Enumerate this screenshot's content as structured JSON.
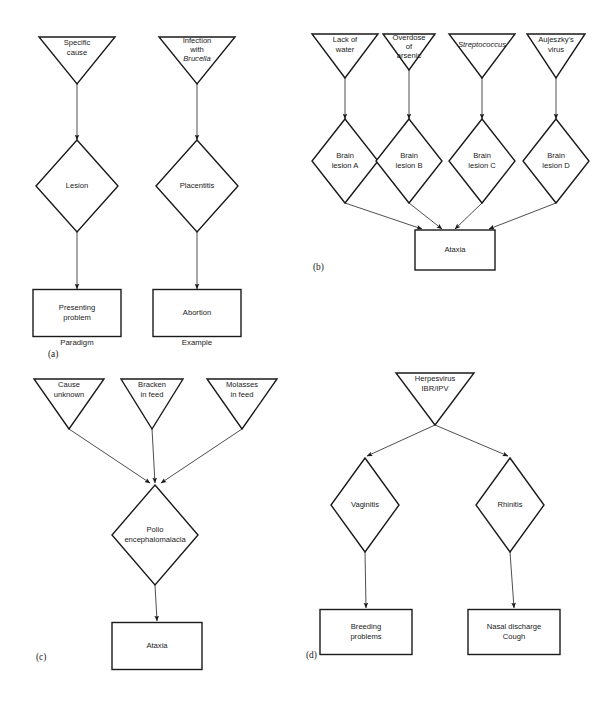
{
  "figure": {
    "background_color": "#ffffff",
    "line_color": "#1a1a1a",
    "connector_color": "#3a3a3a"
  },
  "panels": [
    {
      "id": "a",
      "label": "(a)",
      "label_x": 48,
      "label_y": 357,
      "columns": [
        {
          "caption": "Paradigm",
          "caption_x": 77,
          "caption_y": 345,
          "nodes": [
            {
              "shape": "triangle",
              "lines": [
                "Specific",
                "cause"
              ],
              "cx": 77,
              "cy": 37,
              "w": 76,
              "h": 47
            },
            {
              "shape": "diamond",
              "lines": [
                "Lesion"
              ],
              "cx": 77,
              "cy": 186,
              "w": 82,
              "h": 92
            },
            {
              "shape": "rect",
              "lines": [
                "Presenting",
                "problem"
              ],
              "cx": 77,
              "cy": 313,
              "w": 88,
              "h": 47
            }
          ],
          "arrows": [
            {
              "x1": 77,
              "y1": 84,
              "x2": 77,
              "y2": 140
            },
            {
              "x1": 77,
              "y1": 232,
              "x2": 77,
              "y2": 289
            }
          ]
        },
        {
          "caption": "Example",
          "caption_x": 197,
          "caption_y": 345,
          "nodes": [
            {
              "shape": "triangle",
              "lines": [
                "Infection",
                "with",
                "Brucella"
              ],
              "italic_lines": [
                2
              ],
              "cx": 197,
              "cy": 37,
              "w": 76,
              "h": 47
            },
            {
              "shape": "diamond",
              "lines": [
                "Placentitis"
              ],
              "cx": 197,
              "cy": 186,
              "w": 82,
              "h": 92
            },
            {
              "shape": "rect",
              "lines": [
                "Abortion"
              ],
              "cx": 197,
              "cy": 313,
              "w": 88,
              "h": 47
            }
          ],
          "arrows": [
            {
              "x1": 197,
              "y1": 84,
              "x2": 197,
              "y2": 140
            },
            {
              "x1": 197,
              "y1": 232,
              "x2": 197,
              "y2": 289
            }
          ]
        }
      ]
    },
    {
      "id": "b",
      "label": "(b)",
      "label_x": 313,
      "label_y": 270,
      "causes": [
        {
          "shape": "triangle",
          "lines": [
            "Lack of",
            "water"
          ],
          "cx": 345,
          "cy": 34,
          "w": 66,
          "h": 44
        },
        {
          "shape": "triangle",
          "lines": [
            "Overdose",
            "of",
            "arsenic"
          ],
          "cx": 409,
          "cy": 34,
          "w": 52,
          "h": 36
        },
        {
          "shape": "triangle",
          "lines": [
            "Streptococcus"
          ],
          "italic_lines": [
            0
          ],
          "cx": 482,
          "cy": 34,
          "w": 66,
          "h": 44
        },
        {
          "shape": "triangle",
          "lines": [
            "Aujeszky's",
            "virus"
          ],
          "cx": 556,
          "cy": 34,
          "w": 58,
          "h": 44
        }
      ],
      "lesions": [
        {
          "shape": "diamond",
          "lines": [
            "Brain",
            "lesion A"
          ],
          "cx": 345,
          "cy": 161,
          "w": 66,
          "h": 84
        },
        {
          "shape": "diamond",
          "lines": [
            "Brain",
            "lesion B"
          ],
          "cx": 409,
          "cy": 161,
          "w": 66,
          "h": 84
        },
        {
          "shape": "diamond",
          "lines": [
            "Brain",
            "lesion C"
          ],
          "cx": 482,
          "cy": 161,
          "w": 66,
          "h": 84
        },
        {
          "shape": "diamond",
          "lines": [
            "Brain",
            "lesion D"
          ],
          "cx": 556,
          "cy": 161,
          "w": 66,
          "h": 84
        }
      ],
      "outcome": {
        "shape": "rect",
        "lines": [
          "Ataxia"
        ],
        "cx": 455,
        "cy": 250,
        "w": 80,
        "h": 40
      },
      "arrows_down": [
        {
          "x1": 345,
          "y1": 78,
          "x2": 345,
          "y2": 119
        },
        {
          "x1": 409,
          "y1": 70,
          "x2": 409,
          "y2": 119
        },
        {
          "x1": 482,
          "y1": 78,
          "x2": 482,
          "y2": 119
        },
        {
          "x1": 556,
          "y1": 78,
          "x2": 556,
          "y2": 119
        }
      ],
      "arrows_converge": [
        {
          "x1": 345,
          "y1": 203,
          "x2": 422,
          "y2": 229
        },
        {
          "x1": 409,
          "y1": 203,
          "x2": 442,
          "y2": 229
        },
        {
          "x1": 482,
          "y1": 203,
          "x2": 455,
          "y2": 229
        },
        {
          "x1": 556,
          "y1": 203,
          "x2": 489,
          "y2": 229
        }
      ]
    },
    {
      "id": "c",
      "label": "(c)",
      "label_x": 36,
      "label_y": 660,
      "causes": [
        {
          "shape": "triangle",
          "lines": [
            "Cause",
            "unknown"
          ],
          "cx": 69,
          "cy": 379,
          "w": 70,
          "h": 50
        },
        {
          "shape": "triangle",
          "lines": [
            "Bracken",
            "in feed"
          ],
          "cx": 152,
          "cy": 379,
          "w": 62,
          "h": 50
        },
        {
          "shape": "triangle",
          "lines": [
            "Molasses",
            "in feed"
          ],
          "cx": 242,
          "cy": 379,
          "w": 70,
          "h": 50
        }
      ],
      "intermediate": {
        "shape": "diamond",
        "lines": [
          "Polio",
          "encephalomalacia"
        ],
        "cx": 155,
        "cy": 535,
        "w": 86,
        "h": 100
      },
      "outcome": {
        "shape": "rect",
        "lines": [
          "Ataxia"
        ],
        "cx": 157,
        "cy": 646,
        "w": 90,
        "h": 47
      },
      "arrows_converge": [
        {
          "x1": 69,
          "y1": 429,
          "x2": 150,
          "y2": 483
        },
        {
          "x1": 152,
          "y1": 429,
          "x2": 155,
          "y2": 483
        },
        {
          "x1": 242,
          "y1": 429,
          "x2": 161,
          "y2": 483
        }
      ],
      "arrow_down": {
        "x1": 155,
        "y1": 585,
        "x2": 157,
        "y2": 621
      }
    },
    {
      "id": "d",
      "label": "(d)",
      "label_x": 306,
      "label_y": 658,
      "cause": {
        "shape": "triangle",
        "lines": [
          "Herpesvirus",
          "IBR/IPV"
        ],
        "cx": 435,
        "cy": 373,
        "w": 78,
        "h": 52
      },
      "intermediates": [
        {
          "shape": "diamond",
          "lines": [
            "Vaginitis"
          ],
          "cx": 365,
          "cy": 505,
          "w": 68,
          "h": 94
        },
        {
          "shape": "diamond",
          "lines": [
            "Rhinitis"
          ],
          "cx": 510,
          "cy": 505,
          "w": 68,
          "h": 94
        }
      ],
      "outcomes": [
        {
          "shape": "rect",
          "lines": [
            "Breeding",
            "problems"
          ],
          "cx": 366,
          "cy": 632,
          "w": 92,
          "h": 45
        },
        {
          "shape": "rect",
          "lines": [
            "Nasal discharge",
            "Cough"
          ],
          "cx": 514,
          "cy": 632,
          "w": 92,
          "h": 45
        }
      ],
      "arrows_diverge": [
        {
          "x1": 435,
          "y1": 425,
          "x2": 367,
          "y2": 456
        },
        {
          "x1": 435,
          "y1": 425,
          "x2": 508,
          "y2": 456
        }
      ],
      "arrows_down": [
        {
          "x1": 365,
          "y1": 552,
          "x2": 366,
          "y2": 608
        },
        {
          "x1": 510,
          "y1": 552,
          "x2": 514,
          "y2": 608
        }
      ]
    }
  ]
}
